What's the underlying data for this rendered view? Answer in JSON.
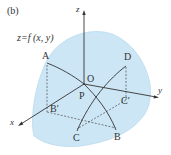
{
  "figure": {
    "panel_label": "(b)",
    "equation": "z=f (x, y)",
    "axes": {
      "x": "x",
      "y": "y",
      "z": "z"
    },
    "points": {
      "A": "A",
      "B": "B",
      "C": "C",
      "D": "D",
      "O": "O",
      "P": "P",
      "B_prime": "B′",
      "C_prime": "C′"
    },
    "colors": {
      "surface_fill": "#cde6f5",
      "surface_edge": "#9fcbe6",
      "line": "#333333",
      "background": "#ffffff"
    }
  }
}
